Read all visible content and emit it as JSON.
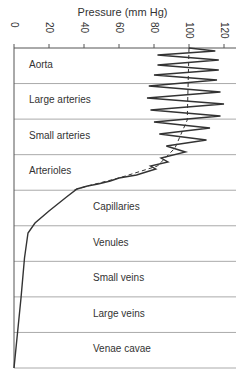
{
  "chart_data": {
    "type": "line",
    "title": "Pressure (mm Hg)",
    "xlabel": "Pressure (mm Hg)",
    "ylabel": "",
    "xlim": [
      0,
      120
    ],
    "x_ticks": [
      "0",
      "20",
      "40",
      "60",
      "80",
      "100",
      "120"
    ],
    "x_axis_position": "top",
    "categories": [
      "Aorta",
      "Large arteries",
      "Small arteries",
      "Arterioles",
      "Capillaries",
      "Venules",
      "Small veins",
      "Large veins",
      "Venae cavae"
    ],
    "series": [
      {
        "name": "Pulsatile pressure",
        "style": "solid",
        "description": "Oscillates ~80-120 in aorta, ~75-125 in large arteries, damping in small arteries, falling to ~35 through arterioles; smooth decline through capillaries (~35 to ~10), venules (~10), veins approaching 0 at venae cavae",
        "values_mean_approx": [
          98,
          98,
          93,
          60,
          20,
          12,
          8,
          5,
          0
        ]
      },
      {
        "name": "Mean pressure",
        "style": "dashed",
        "values_mean_approx": [
          100,
          99,
          92,
          58,
          20,
          12,
          8,
          5,
          0
        ]
      }
    ],
    "grid": "horizontal row dividers"
  }
}
